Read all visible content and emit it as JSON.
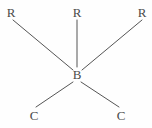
{
  "diagram": {
    "background_color": "#fefefe",
    "bond_color": "#555555",
    "label_color": "#4a4a4a",
    "center_atom": {
      "label": "B",
      "x": 77,
      "y": 74
    },
    "substituents": [
      {
        "label": "R",
        "x": 11,
        "y": 12,
        "name": "r-group-top-left"
      },
      {
        "label": "R",
        "x": 77,
        "y": 12,
        "name": "r-group-top-center"
      },
      {
        "label": "R",
        "x": 142,
        "y": 12,
        "name": "r-group-top-right"
      },
      {
        "label": "C",
        "x": 34,
        "y": 115,
        "name": "carbon-bottom-left"
      },
      {
        "label": "C",
        "x": 121,
        "y": 115,
        "name": "carbon-bottom-right"
      }
    ],
    "bonds": [
      {
        "name": "bond-b-to-r-top-left",
        "x1": 13,
        "y1": 20,
        "x2": 73,
        "y2": 70
      },
      {
        "name": "bond-b-to-r-top-center",
        "x1": 77,
        "y1": 20,
        "x2": 77,
        "y2": 67
      },
      {
        "name": "bond-b-to-r-top-right",
        "x1": 142,
        "y1": 20,
        "x2": 82,
        "y2": 70
      },
      {
        "name": "bond-b-to-c-bottom-left",
        "x1": 73,
        "y1": 82,
        "x2": 36,
        "y2": 107
      },
      {
        "name": "bond-b-to-c-bottom-right",
        "x1": 81,
        "y1": 82,
        "x2": 119,
        "y2": 107
      }
    ]
  }
}
